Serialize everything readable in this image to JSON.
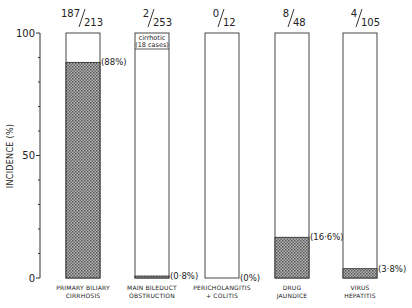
{
  "chart_data": {
    "type": "bar",
    "title": "",
    "xlabel": "",
    "ylabel": "INCIDENCE (%)",
    "ylim": [
      0,
      100
    ],
    "yticks": [
      0,
      50,
      100
    ],
    "minor_tick_step": 10,
    "grid": false,
    "categories": [
      [
        "PRIMARY BILIARY",
        "CIRRHOSIS"
      ],
      [
        "MAIN BILEDUCT",
        "OBSTRUCTION"
      ],
      [
        "PERICHOLANGITIS",
        "+ COLITIS"
      ],
      [
        "DRUG",
        "JAUNDICE"
      ],
      [
        "VIRUS",
        "HEPATITIS"
      ]
    ],
    "values": [
      88,
      0.8,
      0,
      16.6,
      3.8
    ],
    "value_labels": [
      "(88%)",
      "(0·8%)",
      "(0%)",
      "(16·6%)",
      "(3·8%)"
    ],
    "fractions": [
      {
        "num": "187",
        "den": "213"
      },
      {
        "num": "2",
        "den": "253"
      },
      {
        "num": "0",
        "den": "12"
      },
      {
        "num": "8",
        "den": "48"
      },
      {
        "num": "4",
        "den": "105"
      }
    ],
    "annotations": [
      {
        "bar_index": 1,
        "lines": [
          "cirrhotic",
          "(18 cases)"
        ]
      }
    ],
    "fill_pattern": "stippled",
    "bar_edge_color": "#333333",
    "fill_color": "#8a8a8a"
  }
}
